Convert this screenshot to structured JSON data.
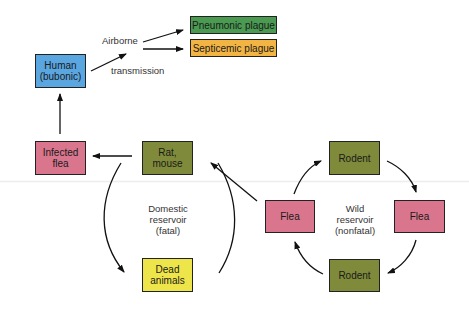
{
  "diagram": {
    "nodes": {
      "human": {
        "label": "Human\n(bubonic)",
        "line1": "Human",
        "line2": "(bubonic)",
        "color": "#5aa6e0"
      },
      "pneumonic": {
        "label": "Pneumonic plague",
        "color": "#4a9a52"
      },
      "septicemic": {
        "label": "Septicemic plague",
        "color": "#f2b544"
      },
      "infected_flea": {
        "line1": "Infected",
        "line2": "flea",
        "color": "#d9768e"
      },
      "rat_mouse": {
        "line1": "Rat,",
        "line2": "mouse",
        "color": "#7f8a3a"
      },
      "dead_animals": {
        "line1": "Dead",
        "line2": "animals",
        "color": "#eee54a"
      },
      "rodent_top": {
        "label": "Rodent",
        "color": "#7f8a3a"
      },
      "flea_left": {
        "label": "Flea",
        "color": "#d9768e"
      },
      "flea_right": {
        "label": "Flea",
        "color": "#d9768e"
      },
      "rodent_bottom": {
        "label": "Rodent",
        "color": "#7f8a3a"
      }
    },
    "labels": {
      "airborne": "Airborne",
      "transmission": "transmission",
      "domestic": {
        "line1": "Domestic",
        "line2": "reservoir",
        "line3": "(fatal)"
      },
      "wild": {
        "line1": "Wild",
        "line2": "reservoir",
        "line3": "(nonfatal)"
      }
    },
    "edges": [
      {
        "from": "human",
        "to": "airborne transmission"
      },
      {
        "from": "airborne transmission",
        "to": "pneumonic"
      },
      {
        "from": "airborne transmission",
        "to": "septicemic"
      },
      {
        "from": "infected_flea",
        "to": "human"
      },
      {
        "from": "rat_mouse",
        "to": "infected_flea"
      },
      {
        "from": "rat_mouse",
        "to": "dead_animals"
      },
      {
        "from": "dead_animals",
        "to": "rat_mouse"
      },
      {
        "from": "flea_left",
        "to": "rat_mouse"
      },
      {
        "from": "flea_left",
        "to": "rodent_top"
      },
      {
        "from": "rodent_top",
        "to": "flea_right"
      },
      {
        "from": "flea_right",
        "to": "rodent_bottom"
      },
      {
        "from": "rodent_bottom",
        "to": "flea_left"
      }
    ]
  }
}
